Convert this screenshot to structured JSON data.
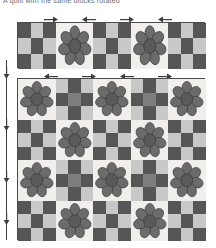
{
  "caption": {
    "text": "A quilt with the same blocks rotated"
  },
  "palette": {
    "dark_gray": "#565656",
    "light_gray": "#c8c8c8",
    "mid_gray": "#7d7d7d",
    "block_background": "#f1efeb",
    "outline": "#4a4a4a",
    "arrow": "#3d3d3d",
    "page_background": "#ffffff"
  },
  "legend": {
    "block_types": [
      "checkerboard-block",
      "flower-block"
    ],
    "checker_variants": [
      "dark-corner",
      "light-corner"
    ]
  },
  "top_strip": {
    "name": "block-row-strip",
    "x": 17,
    "y": 22,
    "width": 188,
    "height": 46,
    "columns": 5,
    "blocks": [
      {
        "type": "checker",
        "variant": "dark-corner"
      },
      {
        "type": "flower",
        "variant": "upright"
      },
      {
        "type": "checker",
        "variant": "dark-corner"
      },
      {
        "type": "flower",
        "variant": "upright"
      },
      {
        "type": "checker",
        "variant": "dark-corner"
      }
    ]
  },
  "top_rail": {
    "name": "rotation-arrow-rail-top",
    "y": 15,
    "arrows": [
      {
        "direction": "right",
        "x": 43
      },
      {
        "direction": "left",
        "x": 81
      },
      {
        "direction": "right",
        "x": 119
      },
      {
        "direction": "left",
        "x": 157
      }
    ]
  },
  "mid_rail": {
    "name": "rotation-arrow-rail-middle",
    "y": 72,
    "arrows": [
      {
        "direction": "left",
        "x": 43
      },
      {
        "direction": "right",
        "x": 81
      },
      {
        "direction": "left",
        "x": 119
      },
      {
        "direction": "right",
        "x": 157
      }
    ]
  },
  "left_rail": {
    "name": "rotation-arrow-rail-left",
    "x": 6,
    "arrows": [
      {
        "direction": "down",
        "y": 66
      },
      {
        "direction": "down",
        "y": 118
      },
      {
        "direction": "down",
        "y": 170
      },
      {
        "direction": "down",
        "y": 212
      }
    ]
  },
  "quilt": {
    "name": "quilt-grid",
    "x": 17,
    "y": 78,
    "width": 188,
    "height": 162,
    "columns": 5,
    "rows": 4,
    "cells": [
      [
        {
          "type": "flower",
          "variant": "upright"
        },
        {
          "type": "checker",
          "variant": "light-corner"
        },
        {
          "type": "flower",
          "variant": "upright"
        },
        {
          "type": "checker",
          "variant": "light-corner"
        },
        {
          "type": "flower",
          "variant": "upright"
        }
      ],
      [
        {
          "type": "checker",
          "variant": "dark-corner"
        },
        {
          "type": "flower",
          "variant": "upright"
        },
        {
          "type": "checker",
          "variant": "dark-corner"
        },
        {
          "type": "flower",
          "variant": "upright"
        },
        {
          "type": "checker",
          "variant": "dark-corner"
        }
      ],
      [
        {
          "type": "flower",
          "variant": "upright"
        },
        {
          "type": "checker",
          "variant": "light-corner"
        },
        {
          "type": "flower",
          "variant": "upright"
        },
        {
          "type": "checker",
          "variant": "light-corner"
        },
        {
          "type": "flower",
          "variant": "upright"
        }
      ],
      [
        {
          "type": "checker",
          "variant": "dark-corner"
        },
        {
          "type": "flower",
          "variant": "upright"
        },
        {
          "type": "checker",
          "variant": "dark-corner"
        },
        {
          "type": "flower",
          "variant": "upright"
        },
        {
          "type": "checker",
          "variant": "dark-corner"
        }
      ]
    ]
  },
  "flower": {
    "petal_count": 7,
    "petal_color": "#6b6b6b",
    "center_color": "#5a5a5a",
    "stroke_color": "#3a3a3a"
  }
}
